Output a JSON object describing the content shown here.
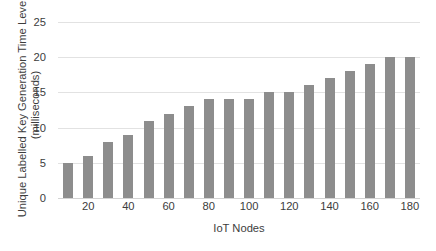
{
  "chart_data": {
    "type": "bar",
    "title": "",
    "xlabel": "IoT Nodes",
    "ylabel_line1": "Unique Labelled Key Generation Time Levels",
    "ylabel_line2": "(milliseconds)",
    "categories": [
      10,
      20,
      30,
      40,
      50,
      60,
      70,
      80,
      90,
      100,
      110,
      120,
      130,
      140,
      150,
      160,
      170,
      180
    ],
    "values": [
      5,
      6,
      8,
      9,
      11,
      12,
      13,
      14,
      14,
      14,
      15,
      15,
      16,
      17,
      18,
      19,
      20,
      20
    ],
    "series": [
      {
        "name": "Unique Labelled Key Generation Time Levels",
        "values": [
          5,
          6,
          8,
          9,
          11,
          12,
          13,
          14,
          14,
          14,
          15,
          15,
          16,
          17,
          18,
          19,
          20,
          20
        ]
      }
    ],
    "ylim": [
      0,
      25
    ],
    "yticks": [
      0,
      5,
      10,
      15,
      20,
      25
    ],
    "ytick_labels": [
      "0",
      "5",
      "10",
      "15",
      "20",
      "25"
    ],
    "xtick_values": [
      20,
      40,
      60,
      80,
      100,
      120,
      140,
      160,
      180
    ],
    "xtick_labels": [
      "20",
      "40",
      "60",
      "80",
      "100",
      "120",
      "140",
      "160",
      "180"
    ],
    "grid": true,
    "grid_axis": "y",
    "legend": false,
    "legend_position": "none",
    "bar_color": "#8d8d8d",
    "grid_color": "#e2e2e2",
    "axis_color": "#d3d3d3",
    "background_color": "#ffffff",
    "text_color": "#3d3d3d"
  }
}
